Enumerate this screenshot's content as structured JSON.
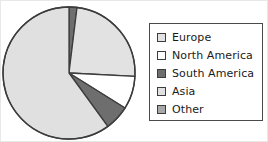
{
  "chart_data": {
    "type": "pie",
    "title": "",
    "categories": [
      "Europe",
      "North America",
      "South America",
      "Asia",
      "Other"
    ],
    "values": [
      24,
      8,
      6,
      60,
      2
    ],
    "unit": "percent",
    "total": 100,
    "start_angle_deg": 0,
    "direction": "clockwise",
    "legend_position": "right",
    "grid": false,
    "colors": [
      "#e2e2e2",
      "#ffffff",
      "#6e6e6e",
      "#e0e0e0",
      "#a8a8a8"
    ],
    "slice_border_color": "#3c3c3c",
    "slices": [
      {
        "label": "Other",
        "value": 2,
        "color": "#6e6e6e",
        "start_deg": 0,
        "end_deg": 7
      },
      {
        "label": "Europe",
        "value": 24,
        "color": "#e2e2e2",
        "start_deg": 7,
        "end_deg": 93
      },
      {
        "label": "North America",
        "value": 8,
        "color": "#ffffff",
        "start_deg": 93,
        "end_deg": 122
      },
      {
        "label": "South America",
        "value": 6,
        "color": "#6e6e6e",
        "start_deg": 122,
        "end_deg": 144
      },
      {
        "label": "Asia",
        "value": 60,
        "color": "#e0e0e0",
        "start_deg": 144,
        "end_deg": 360
      }
    ]
  },
  "pie": {
    "center_x": 68,
    "center_y": 72,
    "radius": 66,
    "outline_color": "#3c3c3c"
  },
  "legend": {
    "items": [
      {
        "label": "Europe",
        "color": "#e2e2e2"
      },
      {
        "label": "North America",
        "color": "#ffffff"
      },
      {
        "label": "South America",
        "color": "#6e6e6e"
      },
      {
        "label": "Asia",
        "color": "#e0e0e0"
      },
      {
        "label": "Other",
        "color": "#a8a8a8"
      }
    ]
  }
}
